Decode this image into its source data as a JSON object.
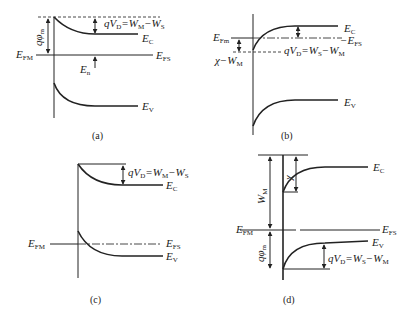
{
  "figure": {
    "panels": [
      {
        "id": "a",
        "caption": "(a)",
        "labels": {
          "qphi": "qφ",
          "qphi_sub": "m",
          "qvd": "qV",
          "qvd_sub": "D",
          "qvd_rhs": "=W",
          "qvd_rhs_sub1": "M",
          "qvd_rhs_mid": "−W",
          "qvd_rhs_sub2": "S",
          "ec": "E",
          "ec_sub": "C",
          "efm": "E",
          "efm_sub": "FM",
          "efs": "E",
          "efs_sub": "FS",
          "en": "E",
          "en_sub": "n",
          "ev": "E",
          "ev_sub": "V"
        }
      },
      {
        "id": "b",
        "caption": "(b)",
        "labels": {
          "efm": "E",
          "efm_sub": "Fm",
          "chi": "χ−W",
          "chi_sub": "M",
          "qvd": "qV",
          "qvd_sub": "D",
          "qvd_rhs": "=W",
          "qvd_rhs_sub1": "S",
          "qvd_rhs_mid": "−W",
          "qvd_rhs_sub2": "M",
          "ec": "E",
          "ec_sub": "C",
          "efs": "−E",
          "efs_sub": "FS",
          "ev": "E",
          "ev_sub": "V"
        }
      },
      {
        "id": "c",
        "caption": "(c)",
        "labels": {
          "qvd": "qV",
          "qvd_sub": "D",
          "qvd_rhs": "=W",
          "qvd_rhs_sub1": "M",
          "qvd_rhs_mid": "−W",
          "qvd_rhs_sub2": "S",
          "ec": "E",
          "ec_sub": "C",
          "efm": "E",
          "efm_sub": "FM",
          "efs": "E",
          "efs_sub": "FS",
          "ev": "E",
          "ev_sub": "V"
        }
      },
      {
        "id": "d",
        "caption": "(d)",
        "labels": {
          "wm": "W",
          "wm_sub": "M",
          "chi": "χ",
          "ec": "E",
          "ec_sub": "C",
          "efm": "E",
          "efm_sub": "FM",
          "efs": "E",
          "efs_sub": "FS",
          "qphi": "qφ",
          "qphi_sub": "m",
          "ev": "E",
          "ev_sub": "V",
          "qvd": "qV",
          "qvd_sub": "D",
          "qvd_rhs": "=W",
          "qvd_rhs_sub1": "S",
          "qvd_rhs_mid": "−W",
          "qvd_rhs_sub2": "M"
        }
      }
    ]
  }
}
